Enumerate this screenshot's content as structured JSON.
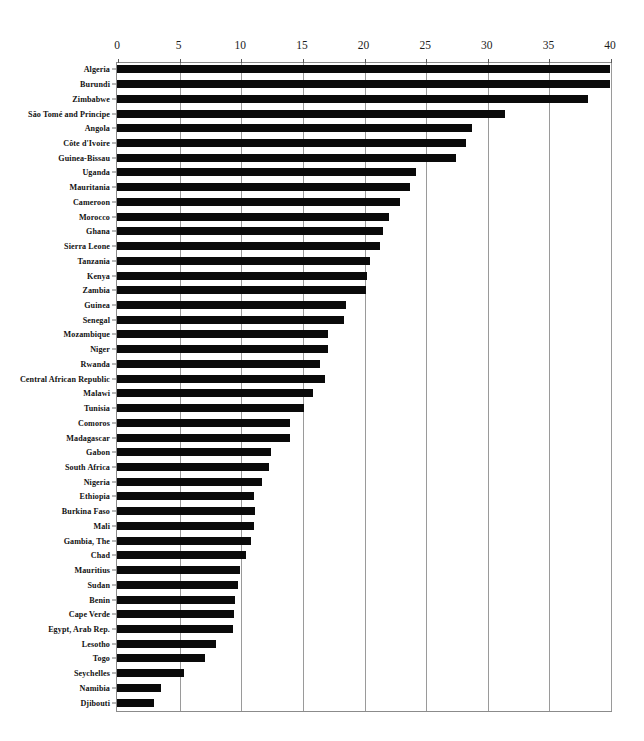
{
  "chart_data": {
    "type": "bar",
    "orientation": "horizontal",
    "title": "",
    "subtitle": "",
    "xlabel": "",
    "ylabel": "",
    "xlim": [
      0,
      40
    ],
    "ylim": null,
    "grid": true,
    "gridlines": "vertical",
    "legend": null,
    "legend_position": "none",
    "bar_color": "#0a0a0a",
    "axis_color": "#8b8b8b",
    "gridline_color": "#9a9a9a",
    "tick_labels": [
      "0",
      "5",
      "10",
      "15",
      "20",
      "25",
      "30",
      "35",
      "40"
    ],
    "tick_values": [
      0,
      5,
      10,
      15,
      20,
      25,
      30,
      35,
      40
    ],
    "categories": [
      "Algeria",
      "Burundi",
      "Zimbabwe",
      "São Tomé and Principe",
      "Angola",
      "Côte d'Ivoire",
      "Guinea-Bissau",
      "Uganda",
      "Mauritania",
      "Cameroon",
      "Morocco",
      "Ghana",
      "Sierra Leone",
      "Tanzania",
      "Kenya",
      "Zambia",
      "Guinea",
      "Senegal",
      "Mozambique",
      "Niger",
      "Rwanda",
      "Central African Republic",
      "Malawi",
      "Tunisia",
      "Comoros",
      "Madagascar",
      "Gabon",
      "South Africa",
      "Nigeria",
      "Ethiopia",
      "Burkina Faso",
      "Mali",
      "Gambia, The",
      "Chad",
      "Mauritius",
      "Sudan",
      "Benin",
      "Cape Verde",
      "Egypt, Arab Rep.",
      "Lesotho",
      "Togo",
      "Seychelles",
      "Namibia",
      "Djibouti"
    ],
    "values": [
      40.0,
      40.0,
      38.2,
      31.5,
      28.8,
      28.3,
      27.5,
      24.3,
      23.8,
      23.0,
      22.1,
      21.6,
      21.3,
      20.5,
      20.3,
      20.2,
      18.6,
      18.4,
      17.1,
      17.1,
      16.5,
      16.9,
      15.9,
      15.2,
      14.0,
      14.0,
      12.5,
      12.3,
      11.8,
      11.1,
      11.2,
      11.1,
      10.9,
      10.5,
      10.0,
      9.8,
      9.6,
      9.5,
      9.4,
      8.0,
      7.1,
      5.4,
      3.6,
      3.0
    ]
  }
}
